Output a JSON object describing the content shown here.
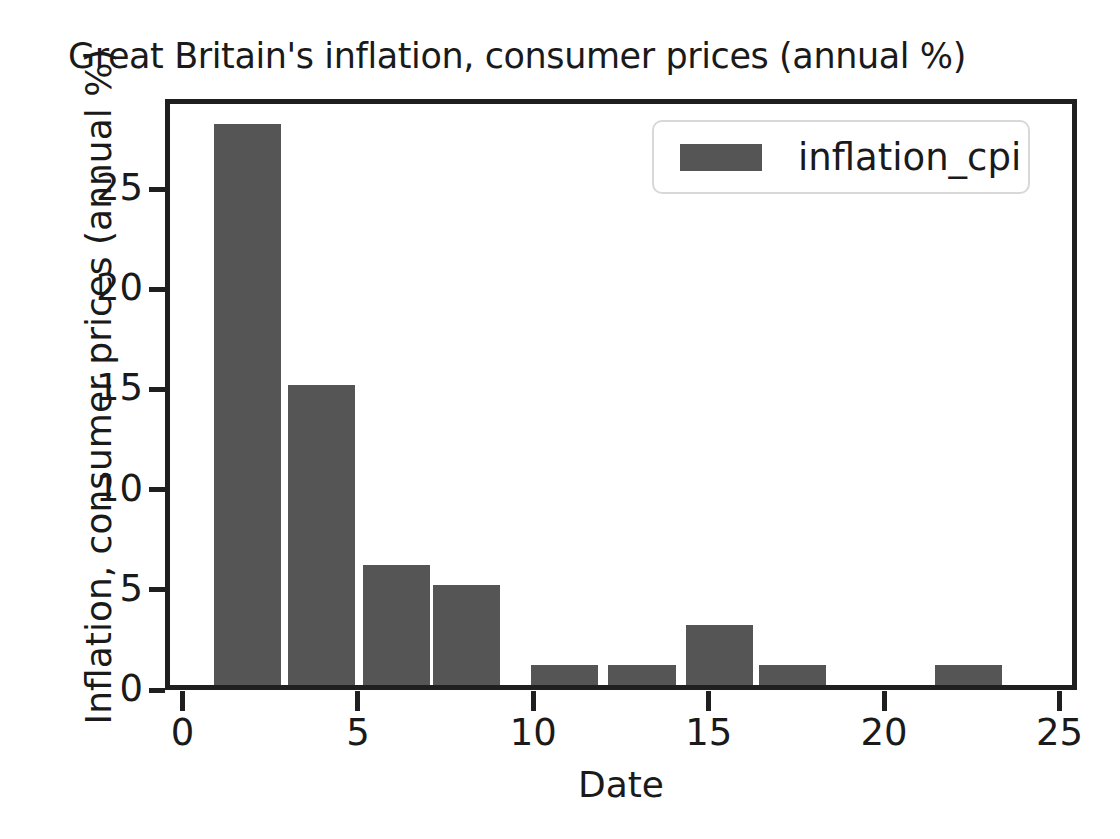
{
  "chart_data": {
    "type": "bar",
    "title": "Great Britain's inflation, consumer prices (annual %)",
    "xlabel": "Date",
    "ylabel": "Inflation, consumer prices (annual %)",
    "grid": false,
    "legend_position": "upper right",
    "xlim": [
      -0.5,
      25.5
    ],
    "ylim": [
      0,
      29.5
    ],
    "xticks": [
      0,
      5,
      10,
      15,
      20,
      25
    ],
    "xtick_labels": [
      "0",
      "5",
      "10",
      "15",
      "20",
      "25"
    ],
    "yticks": [
      0,
      5,
      10,
      15,
      20,
      25
    ],
    "ytick_labels": [
      "0",
      "5",
      "10",
      "15",
      "20",
      "25"
    ],
    "bar_color": "#555555",
    "series": [
      {
        "name": "inflation_cpi",
        "bar_width": 2.0,
        "x": [
          1.75,
          3.85,
          6.0,
          8.0,
          10.8,
          13.0,
          15.2,
          17.3,
          22.3
        ],
        "values": [
          28,
          15,
          6,
          5,
          1,
          1,
          3,
          1,
          1
        ]
      }
    ]
  },
  "legend": {
    "entries": [
      {
        "label": "inflation_cpi",
        "color": "#555555"
      }
    ]
  },
  "axes": {
    "frame_color": "#1f1f1f",
    "text_color": "#1a1a1a"
  }
}
